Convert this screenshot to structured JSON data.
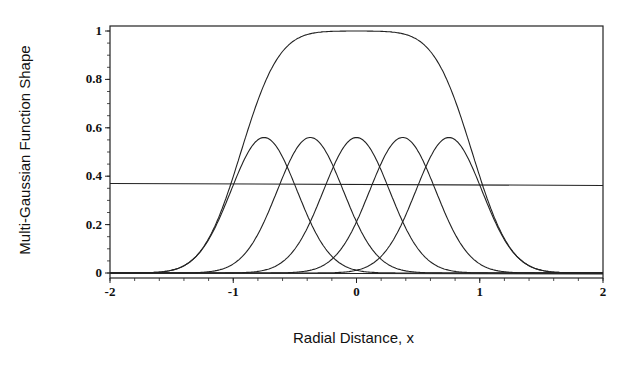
{
  "chart_data": {
    "type": "line",
    "title": "",
    "xlabel": "Radial Distance, x",
    "ylabel": "Multi-Gaussian Function Shape",
    "xlim": [
      -2,
      2
    ],
    "ylim": [
      0,
      1
    ],
    "xticks": [
      "-2",
      "-1",
      "0",
      "1",
      "2"
    ],
    "yticks": [
      "0",
      "0.2",
      "0.4",
      "0.6",
      "0.8",
      "1"
    ],
    "grid": false,
    "legend": null,
    "gaussian_width": 0.38,
    "series": [
      {
        "name": "Gaussian 1",
        "kind": "gaussian",
        "center": -0.75,
        "amplitude": 0.56
      },
      {
        "name": "Gaussian 2",
        "kind": "gaussian",
        "center": -0.375,
        "amplitude": 0.56
      },
      {
        "name": "Gaussian 3",
        "kind": "gaussian",
        "center": 0,
        "amplitude": 0.56
      },
      {
        "name": "Gaussian 4",
        "kind": "gaussian",
        "center": 0.375,
        "amplitude": 0.56
      },
      {
        "name": "Gaussian 5",
        "kind": "gaussian",
        "center": 0.75,
        "amplitude": 0.56
      },
      {
        "name": "Sum of Gaussians",
        "kind": "sum",
        "peak": 1.0
      },
      {
        "name": "Threshold (1/e)",
        "kind": "constant",
        "value": 0.37
      }
    ]
  }
}
